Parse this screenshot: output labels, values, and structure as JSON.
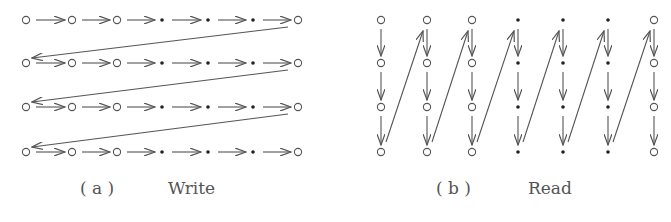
{
  "panels": [
    {
      "id": "a",
      "tag": "( a )",
      "caption": "Write",
      "grid": {
        "rows": 4,
        "cols": 7,
        "col_x": [
          26,
          72,
          117,
          162,
          208,
          253,
          298
        ],
        "row_y": [
          20,
          63,
          107,
          152
        ],
        "node_types": [
          "open",
          "open",
          "open",
          "dot",
          "dot",
          "dot",
          "open"
        ]
      },
      "direction": "row-major, left to right, wrap to next row start"
    },
    {
      "id": "b",
      "tag": "( b )",
      "caption": "Read",
      "grid": {
        "rows": 4,
        "cols": 7,
        "col_x": [
          381,
          427,
          472,
          518,
          563,
          608,
          654
        ],
        "row_y": [
          20,
          63,
          107,
          152
        ],
        "node_types": [
          "open",
          "open",
          "open",
          "dot",
          "dot",
          "dot",
          "open"
        ]
      },
      "direction": "column-major, top to bottom, wrap to next column top"
    }
  ],
  "colors": {
    "stroke": "#555555",
    "node": "#555555",
    "dot": "#222222",
    "text": "#555555"
  }
}
